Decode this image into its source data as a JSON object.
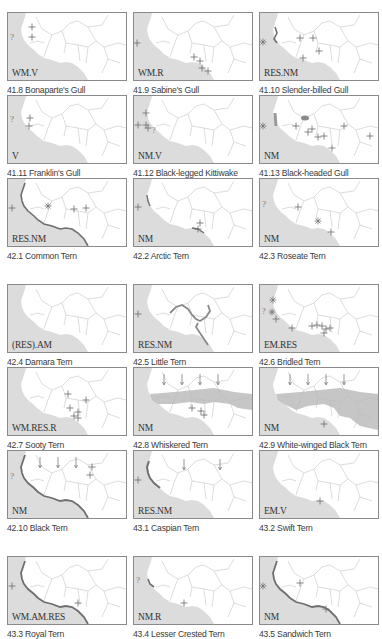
{
  "colors": {
    "sea": "#dcdcdc",
    "land": "#ffffff",
    "border": "#bdbdbd",
    "frame": "#8a8a8a",
    "marker": "#6a6a6a",
    "shade": "#b0b0b0",
    "coast": "#6f6f6f"
  },
  "maps": [
    {
      "number": "41.8",
      "name": "Bonaparte's Gull",
      "caption": "41.8 Bonaparte's Gull",
      "status": "WM.V",
      "symbols": [
        "?",
        "+",
        "+"
      ]
    },
    {
      "number": "41.9",
      "name": "Sabine's Gull",
      "caption": "41.9 Sabine's Gull",
      "status": "WM.R",
      "symbols": [
        "+",
        "+",
        "+",
        "+",
        "+"
      ]
    },
    {
      "number": "41.10",
      "name": "Slender-billed Gull",
      "caption": "41.10 Slender-billed Gull",
      "status": "RES.NM",
      "symbols": [
        "*",
        "+",
        "+",
        "+",
        "+"
      ]
    },
    {
      "number": "41.11",
      "name": "Franklin's Gull",
      "caption": "41.11 Franklin's Gull",
      "status": "V",
      "symbols": [
        "?",
        "+",
        "+"
      ]
    },
    {
      "number": "41.12",
      "name": "Black-legged Kittiwake",
      "caption": "41.12 Black-legged Kittiwake",
      "status": "NM.V",
      "symbols": [
        "+",
        "+",
        "+",
        "?"
      ]
    },
    {
      "number": "41.13",
      "name": "Black-headed Gull",
      "caption": "41.13 Black-headed Gull",
      "status": "NM",
      "symbols": [
        "*",
        "+",
        "+",
        "+",
        "+",
        "+",
        "+",
        "+"
      ]
    },
    {
      "number": "42.1",
      "name": "Common Tern",
      "caption": "42.1 Common Tern",
      "status": "RES.NM",
      "symbols": [
        "+",
        "*",
        "+",
        "+"
      ]
    },
    {
      "number": "42.2",
      "name": "Arctic Tern",
      "caption": "42.2 Arctic Tern",
      "status": "NM",
      "symbols": [
        "+",
        "+"
      ]
    },
    {
      "number": "42.3",
      "name": "Roseate Tern",
      "caption": "42.3 Roseate Tern",
      "status": "NM",
      "symbols": [
        "?",
        "+",
        "*",
        "+"
      ]
    },
    {
      "number": "42.4",
      "name": "Damara Tern",
      "caption": "42.4 Damara Tern",
      "status": "(RES).AM",
      "symbols": []
    },
    {
      "number": "42.5",
      "name": "Little Tern",
      "caption": "42.5 Little Tern",
      "status": "RES.NM",
      "symbols": [
        "+"
      ]
    },
    {
      "number": "42.6",
      "name": "Bridled Tern",
      "caption": "42.6 Bridled Tern",
      "status": "EM.RES",
      "symbols": [
        "*",
        "*",
        "?",
        "+",
        "+",
        "+",
        "+"
      ]
    },
    {
      "number": "42.7",
      "name": "Sooty Tern",
      "caption": "42.7 Sooty Tern",
      "status": "WM.RES.R",
      "symbols": [
        "+",
        "+",
        "+",
        "+"
      ]
    },
    {
      "number": "42.8",
      "name": "Whiskered Tern",
      "caption": "42.8 Whiskered Tern",
      "status": "NM",
      "symbols": [
        "+",
        "+"
      ]
    },
    {
      "number": "42.9",
      "name": "White-winged Black Tern",
      "caption": "42.9 White-winged Black Tern",
      "status": "NM",
      "symbols": [
        "+"
      ]
    },
    {
      "number": "42.10",
      "name": "Black Tern",
      "caption": "42.10 Black Tern",
      "status": "NM",
      "symbols": [
        "?",
        "+",
        "+"
      ]
    },
    {
      "number": "43.1",
      "name": "Caspian Tern",
      "caption": "43.1 Caspian Tern",
      "status": "RES.NM",
      "symbols": [
        "+"
      ]
    },
    {
      "number": "43.2",
      "name": "Swift Tern",
      "caption": "43.2 Swift Tern",
      "status": "EM.V",
      "symbols": [
        "+"
      ]
    },
    {
      "number": "43.3",
      "name": "Royal Tern",
      "caption": "43.3 Royal Tern",
      "status": "WM.AM.RES",
      "symbols": [
        "+",
        "+"
      ]
    },
    {
      "number": "43.4",
      "name": "Lesser Crested Tern",
      "caption": "43.4 Lesser Crested Tern",
      "status": "NM.R",
      "symbols": [
        "?",
        "+"
      ]
    },
    {
      "number": "43.5",
      "name": "Sandwich Tern",
      "caption": "43.5 Sandwich Tern",
      "status": "NM",
      "symbols": [
        "*",
        "+",
        "+"
      ]
    }
  ]
}
